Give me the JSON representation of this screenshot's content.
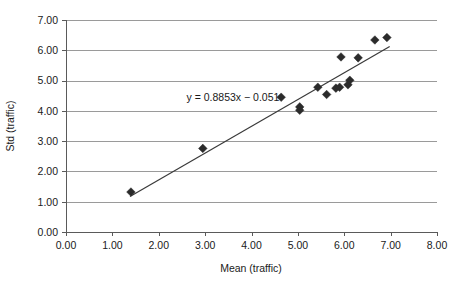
{
  "chart_data": {
    "type": "scatter",
    "title": "",
    "xlabel": "Mean (traffic)",
    "ylabel": "Std (traffic)",
    "xlim": [
      0.0,
      8.0
    ],
    "ylim": [
      0.0,
      7.0
    ],
    "xticks": [
      "0.00",
      "1.00",
      "2.00",
      "3.00",
      "4.00",
      "5.00",
      "6.00",
      "7.00",
      "8.00"
    ],
    "yticks": [
      "0.00",
      "1.00",
      "2.00",
      "3.00",
      "4.00",
      "5.00",
      "6.00",
      "7.00"
    ],
    "xtick_values": [
      0.0,
      1.0,
      2.0,
      3.0,
      4.0,
      5.0,
      6.0,
      7.0,
      8.0
    ],
    "ytick_values": [
      0.0,
      1.0,
      2.0,
      3.0,
      4.0,
      5.0,
      6.0,
      7.0
    ],
    "grid": "horizontal",
    "legend": "none",
    "marker_shape": "diamond",
    "marker_color": "#2b2b2b",
    "trendline_color": "#3a3a3a",
    "gridline_color": "#9a9a9a",
    "axis_color": "#5a5a5a",
    "background_color": "#ffffff",
    "annotation": "y = 0.8853x − 0.051",
    "annotation_x": 3.6,
    "annotation_y": 4.45,
    "trendline": {
      "slope": 0.8853,
      "intercept": -0.051,
      "x_start": 1.38,
      "x_end": 6.98
    },
    "points": [
      {
        "x": 1.4,
        "y": 1.32
      },
      {
        "x": 2.95,
        "y": 2.76
      },
      {
        "x": 4.64,
        "y": 4.45
      },
      {
        "x": 5.04,
        "y": 4.13
      },
      {
        "x": 5.04,
        "y": 4.02
      },
      {
        "x": 5.43,
        "y": 4.78
      },
      {
        "x": 5.62,
        "y": 4.54
      },
      {
        "x": 5.82,
        "y": 4.75
      },
      {
        "x": 5.9,
        "y": 4.78
      },
      {
        "x": 5.93,
        "y": 5.78
      },
      {
        "x": 6.08,
        "y": 4.86
      },
      {
        "x": 6.12,
        "y": 5.01
      },
      {
        "x": 6.3,
        "y": 5.75
      },
      {
        "x": 6.66,
        "y": 6.34
      },
      {
        "x": 6.92,
        "y": 6.42
      }
    ]
  }
}
